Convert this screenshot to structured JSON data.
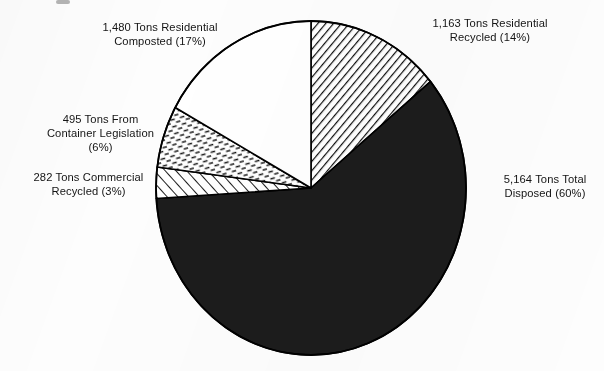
{
  "chart_data": {
    "type": "pie",
    "title": "",
    "subtitle": "",
    "unit": "Tons",
    "legend_position": "around-slices",
    "grid": false,
    "total_value": 8584,
    "categories": [
      "Residential Recycled",
      "Total Disposed",
      "Commercial Recycled",
      "From Container Legislation",
      "Residential Composted"
    ],
    "values": [
      1163,
      5164,
      282,
      495,
      1480
    ],
    "percents": [
      14,
      60,
      3,
      6,
      17
    ],
    "slices": [
      {
        "id": "residential-recycled",
        "name": "Residential Recycled",
        "value": 1163,
        "value_text": "1,163",
        "percent": 14,
        "percent_text": "(14%)",
        "label_line1": "1,163 Tons Residential",
        "label_line2": "Recycled (14%)",
        "start_angle": 0,
        "end_angle": 50.4,
        "fill_style": "diagonal-hatch-dense-backslash",
        "fill_color": "#ffffff",
        "stroke_color": "#000000"
      },
      {
        "id": "total-disposed",
        "name": "Total Disposed",
        "value": 5164,
        "value_text": "5,164",
        "percent": 60,
        "percent_text": "(60%)",
        "label_line1": "5,164 Tons Total",
        "label_line2": "Disposed (60%)",
        "start_angle": 50.4,
        "end_angle": 266.4,
        "fill_style": "solid-black",
        "fill_color": "#1c1c1c",
        "stroke_color": "#000000"
      },
      {
        "id": "commercial-recycled",
        "name": "Commercial Recycled",
        "value": 282,
        "value_text": "282",
        "percent": 3,
        "percent_text": "(3%)",
        "label_line1": "282 Tons Commercial",
        "label_line2": "Recycled (3%)",
        "start_angle": 266.4,
        "end_angle": 277.2,
        "fill_style": "diagonal-hatch-slash",
        "fill_color": "#ffffff",
        "stroke_color": "#000000"
      },
      {
        "id": "container-legislation",
        "name": "From Container Legislation",
        "value": 495,
        "value_text": "495",
        "percent": 6,
        "percent_text": "(6%)",
        "label_line1": "495 Tons From",
        "label_line2": "Container Legislation",
        "label_line3": "(6%)",
        "start_angle": 277.2,
        "end_angle": 298.8,
        "fill_style": "dash-brick-texture",
        "fill_color": "#ffffff",
        "stroke_color": "#000000"
      },
      {
        "id": "residential-composted",
        "name": "Residential Composted",
        "value": 1480,
        "value_text": "1,480",
        "percent": 17,
        "percent_text": "(17%)",
        "label_line1": "1,480 Tons Residential",
        "label_line2": "Composted (17%)",
        "start_angle": 298.8,
        "end_angle": 360,
        "fill_style": "solid-white",
        "fill_color": "#ffffff",
        "stroke_color": "#000000"
      }
    ],
    "geometry": {
      "center_x": 311,
      "center_y": 188,
      "radius_x": 155,
      "radius_y": 167
    },
    "colors": {
      "background": "#fdfdfd",
      "outline": "#000000",
      "text": "#141414",
      "disposed_fill": "#1c1c1c"
    }
  },
  "labels": {
    "residential_recycled": "1,163 Tons Residential\nRecycled (14%)",
    "residential_composted": "1,480 Tons Residential\nComposted (17%)",
    "container_legislation": "495 Tons From\nContainer Legislation\n(6%)",
    "commercial_recycled": "282 Tons Commercial\nRecycled (3%)",
    "total_disposed": "5,164 Tons Total\nDisposed (60%)"
  }
}
